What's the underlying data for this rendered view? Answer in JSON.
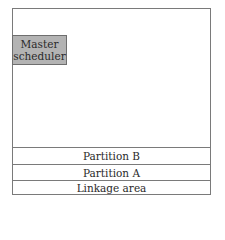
{
  "diagram": {
    "type": "memory-layout",
    "master_scheduler": {
      "line1": "Master",
      "line2": "scheduler",
      "fill": "#b3b3b3"
    },
    "partitions": [
      {
        "label": "Partition B"
      },
      {
        "label": "Partition A"
      },
      {
        "label": "Linkage area"
      }
    ],
    "border_color": "#7a7a7a"
  }
}
